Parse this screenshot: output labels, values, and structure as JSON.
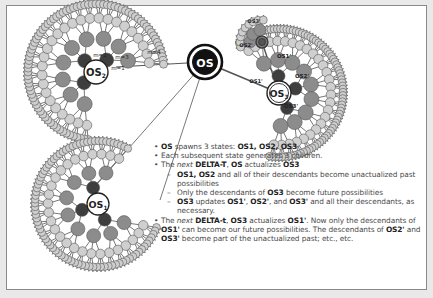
{
  "diagram": {
    "root_label": "OS",
    "clusters": {
      "os2": {
        "label": "OS",
        "sub": "2",
        "depth_labels": [
          "m=1",
          "m=2",
          "m=3",
          "m=4"
        ]
      },
      "os1": {
        "label": "OS",
        "sub": "1"
      },
      "os3": {
        "label": "OS",
        "sub": "3",
        "child_labels": [
          "OS1'",
          "OS2'",
          "OS3'"
        ],
        "grandchild_labels": [
          "OS3'",
          "OS2'",
          "OS1'"
        ]
      }
    },
    "colors": {
      "leaf": "#cfcfcf",
      "mid": "#8c8c8c",
      "dark": "#3e3e3e",
      "root": "#111111",
      "line": "#555555"
    }
  },
  "notes": {
    "b1": {
      "a": "OS",
      "b": " spawns 3 states: ",
      "c": "OS1, OS2, OS3"
    },
    "b2": "Each subsequent state generates 3 children.",
    "b3": {
      "a": "The ",
      "b": "next",
      "c": " DELTA-T",
      "d": ", ",
      "e": "OS",
      "f": " actualizes ",
      "g": "OS3"
    },
    "s1": {
      "a": "OS1, OS2",
      "b": " and all of their descendants become unactualized past possibilities"
    },
    "s2": {
      "a": "Only the descendants of ",
      "b": "OS3",
      "c": " become future possibilities"
    },
    "s3": {
      "a": "OS3",
      "b": " updates ",
      "c": "OS1'",
      "d": ", ",
      "e": "OS2'",
      "f": ", and ",
      "g": "OS3'",
      "h": " and all their descendants, as necessary."
    },
    "b4": {
      "a": "The ",
      "b": "next",
      "c": " DELTA-t",
      "d": ", ",
      "e": "OS3",
      "f": " actualizes ",
      "g": "OS1'",
      "h": ". Now only the descendants of ",
      "i": "OS1'",
      "j": " can become our future possibilities. The descendants of ",
      "k": "OS2'",
      "l": " and ",
      "m": "OS3'",
      "n": " become part of the unactualized past; etc., etc."
    }
  }
}
